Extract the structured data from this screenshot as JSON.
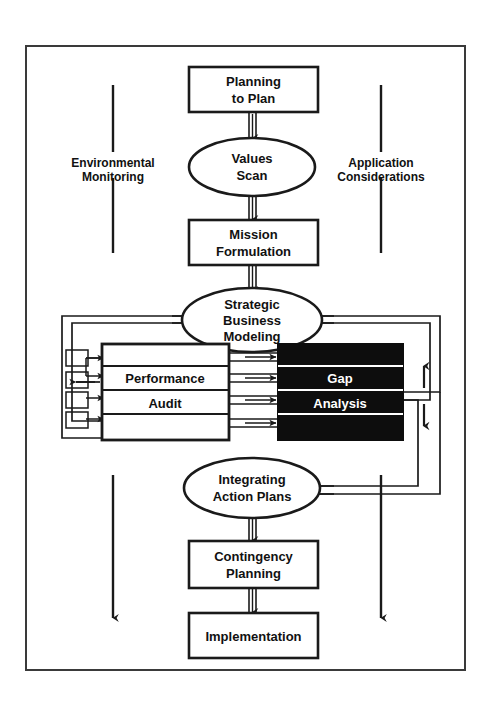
{
  "diagram": {
    "type": "flowchart",
    "colors": {
      "line": "#1a1a1a",
      "box_fill": "#ffffff",
      "highlight_fill": "#0d0d0d",
      "highlight_text": "#ffffff",
      "text": "#111111",
      "background": "#ffffff"
    },
    "frame": {
      "x": 25,
      "y": 45,
      "width": 440,
      "height": 625
    },
    "nodes": [
      {
        "id": "planning-to-plan",
        "shape": "rectangle",
        "line1": "Planning",
        "line2": "to Plan"
      },
      {
        "id": "values-scan",
        "shape": "ellipse",
        "line1": "Values",
        "line2": "Scan"
      },
      {
        "id": "mission-formulation",
        "shape": "rectangle",
        "line1": "Mission",
        "line2": "Formulation"
      },
      {
        "id": "strategic-business-modeling",
        "shape": "ellipse",
        "line1": "Strategic",
        "line2": "Business",
        "line3": "Modeling"
      },
      {
        "id": "performance-audit",
        "shape": "banded-rectangle",
        "line1": "Performance",
        "line2": "Audit",
        "bands": 4
      },
      {
        "id": "gap-analysis",
        "shape": "banded-rectangle-inverted",
        "line1": "Gap",
        "line2": "Analysis",
        "bands": 4
      },
      {
        "id": "integrating-action-plans",
        "shape": "ellipse",
        "line1": "Integrating",
        "line2": "Action Plans"
      },
      {
        "id": "contingency-planning",
        "shape": "rectangle",
        "line1": "Contingency",
        "line2": "Planning"
      },
      {
        "id": "implementation",
        "shape": "rectangle",
        "line1": "Implementation",
        "line2": ""
      }
    ],
    "side_labels": [
      {
        "id": "environmental-monitoring",
        "line1": "Environmental",
        "line2": "Monitoring",
        "side": "left"
      },
      {
        "id": "application-considerations",
        "line1": "Application",
        "line2": "Considerations",
        "side": "right"
      }
    ]
  }
}
